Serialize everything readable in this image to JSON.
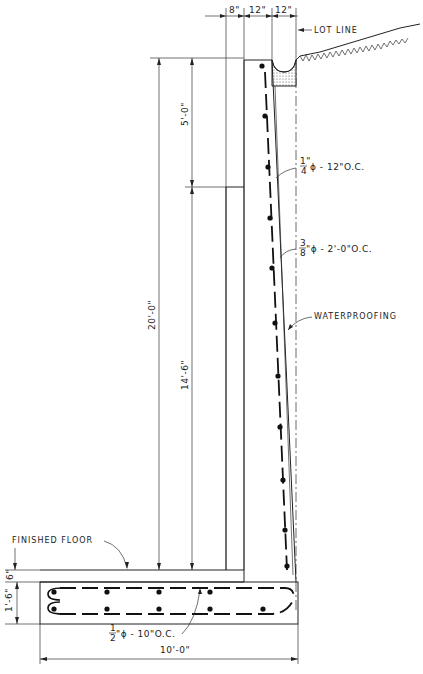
{
  "drawing": {
    "title": "Retaining wall section",
    "top_dimensions": [
      "8\"",
      "12\"",
      "12\""
    ],
    "labels": {
      "lot_line": "LOT LINE",
      "rebar_vertical": "1/4\" ϕ - 12\" O.C.",
      "rebar_vertical_frac": "1\"",
      "rebar_vertical_den": "4",
      "rebar_vertical_rest": "ϕ - 12\"O.C.",
      "rebar_horizontal_num": "3",
      "rebar_horizontal_den": "8",
      "rebar_horizontal_rest": "\"ϕ - 2'-0\"O.C.",
      "waterproofing": "WATERPROOFING",
      "finished_floor": "FINISHED FLOOR",
      "footing_rebar_num": "1",
      "footing_rebar_den": "2",
      "footing_rebar_rest": "\"ϕ - 10\"O.C."
    },
    "vertical_dimensions": {
      "total_height": "20'-0\"",
      "upper": "5'-0\"",
      "lower": "14'-6\"",
      "slab": "6\"",
      "footing": "1'-6\""
    },
    "horizontal_dimensions": {
      "footing_width": "10'-0\""
    }
  }
}
